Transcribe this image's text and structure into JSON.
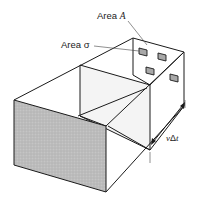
{
  "diagram": {
    "labels": {
      "area_A_prefix": "Area ",
      "area_A_symbol": "A",
      "area_sigma_prefix": "Area ",
      "area_sigma_symbol": "σ",
      "length_prefix": "v",
      "length_delta": "Δ",
      "length_t": "t"
    },
    "elements": {
      "front_face": "shaded cross-section (gray stipple)",
      "target_plate": "back plate of area A with four small targets of area σ",
      "target_count": 4,
      "length_dimension": "vΔt"
    },
    "colors": {
      "line": "#1a1a1a",
      "front_face_fill": "#b9b9b9",
      "target_fill": "#a8a8a8",
      "inner_face_fill": "#f4f4f4",
      "background": "#ffffff"
    }
  }
}
